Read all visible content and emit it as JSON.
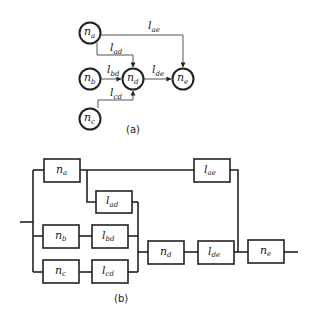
{
  "diagram_a": {
    "caption": "(a)",
    "nodes": [
      {
        "id": "na",
        "base": "n",
        "sub": "a",
        "cx": 90,
        "cy": 33
      },
      {
        "id": "nb",
        "base": "n",
        "sub": "b",
        "cx": 90,
        "cy": 79
      },
      {
        "id": "nc",
        "base": "n",
        "sub": "c",
        "cx": 90,
        "cy": 119
      },
      {
        "id": "nd",
        "base": "n",
        "sub": "d",
        "cx": 133,
        "cy": 79
      },
      {
        "id": "ne",
        "base": "n",
        "sub": "e",
        "cx": 183,
        "cy": 79
      }
    ],
    "edges": [
      {
        "id": "lae",
        "base": "l",
        "sub": "ae",
        "from": "na",
        "to": "ne",
        "label_x": 148,
        "label_y": 29
      },
      {
        "id": "lad",
        "base": "l",
        "sub": "ad",
        "from": "na",
        "to": "nd",
        "label_x": 110,
        "label_y": 51
      },
      {
        "id": "lbd",
        "base": "l",
        "sub": "bd",
        "from": "nb",
        "to": "nd",
        "label_x": 107,
        "label_y": 73
      },
      {
        "id": "lde",
        "base": "l",
        "sub": "de",
        "from": "nd",
        "to": "ne",
        "label_x": 152,
        "label_y": 73
      },
      {
        "id": "lcd",
        "base": "l",
        "sub": "cd",
        "from": "nc",
        "to": "nd",
        "label_x": 110,
        "label_y": 96
      }
    ]
  },
  "diagram_b": {
    "caption": "(b)",
    "blocks": [
      {
        "id": "na",
        "base": "n",
        "sub": "a",
        "x": 44,
        "y": 159,
        "w": 36,
        "h": 23
      },
      {
        "id": "lae",
        "base": "l",
        "sub": "ae",
        "x": 194,
        "y": 159,
        "w": 36,
        "h": 23
      },
      {
        "id": "lad",
        "base": "l",
        "sub": "ad",
        "x": 96,
        "y": 191,
        "w": 36,
        "h": 22
      },
      {
        "id": "nb",
        "base": "n",
        "sub": "b",
        "x": 43,
        "y": 225,
        "w": 36,
        "h": 23
      },
      {
        "id": "lbd",
        "base": "l",
        "sub": "bd",
        "x": 92,
        "y": 225,
        "w": 36,
        "h": 23
      },
      {
        "id": "nc",
        "base": "n",
        "sub": "c",
        "x": 43,
        "y": 260,
        "w": 36,
        "h": 23
      },
      {
        "id": "lcd",
        "base": "l",
        "sub": "cd",
        "x": 92,
        "y": 260,
        "w": 36,
        "h": 23
      },
      {
        "id": "nd",
        "base": "n",
        "sub": "d",
        "x": 148,
        "y": 241,
        "w": 36,
        "h": 23
      },
      {
        "id": "lde",
        "base": "l",
        "sub": "de",
        "x": 198,
        "y": 241,
        "w": 36,
        "h": 23
      },
      {
        "id": "ne",
        "base": "n",
        "sub": "e",
        "x": 248,
        "y": 240,
        "w": 36,
        "h": 23
      }
    ]
  }
}
